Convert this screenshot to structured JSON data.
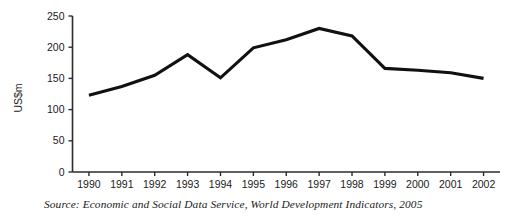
{
  "chart_data": {
    "type": "line",
    "title": "",
    "xlabel": "",
    "ylabel": "US$m",
    "categories": [
      "1990",
      "1991",
      "1992",
      "1993",
      "1994",
      "1995",
      "1996",
      "1997",
      "1998",
      "1999",
      "2000",
      "2001",
      "2002"
    ],
    "values": [
      123,
      137,
      155,
      188,
      151,
      199,
      212,
      230,
      218,
      166,
      163,
      159,
      150
    ],
    "series": [
      {
        "name": "US$m",
        "values": [
          123,
          137,
          155,
          188,
          151,
          199,
          212,
          230,
          218,
          166,
          163,
          159,
          150
        ]
      }
    ],
    "ylim": [
      0,
      250
    ],
    "yticks": [
      0,
      50,
      100,
      150,
      200,
      250
    ],
    "ytick_labels": [
      "0",
      "50",
      "100",
      "150",
      "200",
      "250"
    ],
    "grid": false,
    "legend": false,
    "line_color": "#111111"
  },
  "source": {
    "text": "Source: Economic and Social Data Service, World Development Indicators, 2005"
  }
}
